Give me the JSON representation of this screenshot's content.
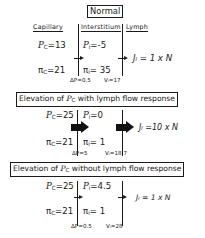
{
  "columns": {
    "capillary": "Capillary",
    "interstitium": "Interstitium",
    "lymph": "Lymph"
  },
  "sections": [
    {
      "title": "Normal",
      "Pc_label": "P",
      "Pc_sub": "C",
      "Pc_value": "=13",
      "Pi_label": "P",
      "Pi_sub": "i",
      "Pi_value": "=-5",
      "Pic_label": "π",
      "Pic_sub": "C",
      "Pic_value": "=21",
      "Pii_label": "π",
      "Pii_sub": "i",
      "Pii_value": "= 35",
      "dP": "ΔP=0.5",
      "Vi": "Vᵢ=17",
      "JL": "Jₗ = 1 x N",
      "arrow_style": "small"
    },
    {
      "title_prefix": "Elevation of ",
      "title_var": "P",
      "title_sub": "C",
      "title_suffix": " with lymph flow response",
      "Pc_label": "P",
      "Pc_sub": "C",
      "Pc_value": "=25",
      "Pi_label": "P",
      "Pi_sub": "i",
      "Pi_value": "=0",
      "Pic_label": "π",
      "Pic_sub": "C",
      "Pic_value": "=21",
      "Pii_label": "π",
      "Pii_sub": "i",
      "Pii_value": "= 1",
      "dP": "ΔP=5",
      "Vi": "Vᵢ=18.7",
      "JL": "Jₗ =10 x N",
      "arrow_style": "large"
    },
    {
      "title_prefix": "Elevation of ",
      "title_var": "P",
      "title_sub": "C",
      "title_suffix": " without lymph flow response",
      "Pc_label": "P",
      "Pc_sub": "C",
      "Pc_value": "=25",
      "Pi_label": "P",
      "Pi_sub": "i",
      "Pi_value": "=4.5",
      "Pic_label": "π",
      "Pic_sub": "C",
      "Pic_value": "=21",
      "Pii_label": "π",
      "Pii_sub": "i",
      "Pii_value": "= 1",
      "dP": "ΔP=0.5",
      "Vi": "Vᵢ=28",
      "JL": "Jₗ = 1 x N",
      "arrow_style": "small"
    }
  ]
}
